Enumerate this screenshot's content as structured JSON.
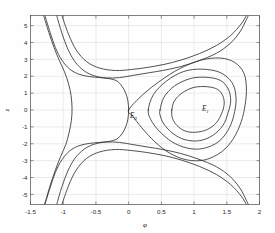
{
  "figure": {
    "background_color": "#fefefe",
    "curve_color": "#333333",
    "grid_color": "#d8d8d8",
    "axis_color": "#4a4a4a"
  },
  "chart_data": {
    "type": "line",
    "title": "",
    "subtitle": "",
    "xlabel": "φ",
    "ylabel": "z",
    "xlim": [
      -1.5,
      2.0
    ],
    "ylim": [
      -5.6,
      5.6
    ],
    "grid": true,
    "legend": null,
    "legend_position": "none",
    "xticks": [
      -1.5,
      -1,
      -0.5,
      0,
      0.5,
      1,
      1.5,
      2
    ],
    "xticklabels": [
      "-1.5",
      "-1",
      "-0.5",
      "0",
      "0.5",
      "1",
      "1.5",
      "2"
    ],
    "yticks": [
      -5,
      -4,
      -3,
      -2,
      -1,
      0,
      1,
      2,
      3,
      4,
      5
    ],
    "yticklabels": [
      "-5",
      "-4",
      "-3",
      "-2",
      "-1",
      "0",
      "1",
      "2",
      "3",
      "4",
      "5"
    ],
    "annotations": [
      {
        "text": "E",
        "subscript": "0",
        "x": 0.02,
        "y": -0.45,
        "name": "saddle-point-label"
      },
      {
        "text": "E",
        "subscript": "1",
        "x": 1.12,
        "y": -0.05,
        "name": "center-point-label"
      }
    ],
    "equilibria": [
      {
        "name": "E0",
        "type": "saddle",
        "x": 0.0,
        "y": 0.0
      },
      {
        "name": "E1",
        "type": "center",
        "x": 1.1,
        "y": 0.0
      }
    ],
    "series": [
      {
        "name": "separatrix",
        "type": "homoclinic-separatrix",
        "values": [
          [
            -1.28,
            5.6
          ],
          [
            -1.2,
            4.6
          ],
          [
            -1.12,
            3.7
          ],
          [
            -1.02,
            2.95
          ],
          [
            -0.9,
            2.42
          ],
          [
            -0.76,
            2.12
          ],
          [
            -0.6,
            1.98
          ],
          [
            -0.44,
            1.92
          ],
          [
            -0.3,
            1.86
          ],
          [
            -0.18,
            1.72
          ],
          [
            -0.1,
            1.4
          ],
          [
            -0.045,
            1.0
          ],
          [
            -0.012,
            0.55
          ],
          [
            0.0,
            0.0
          ],
          [
            -0.012,
            -0.55
          ],
          [
            -0.045,
            -1.0
          ],
          [
            -0.1,
            -1.4
          ],
          [
            -0.18,
            -1.72
          ],
          [
            -0.3,
            -1.86
          ],
          [
            -0.44,
            -1.92
          ],
          [
            -0.6,
            -1.98
          ],
          [
            -0.76,
            -2.12
          ],
          [
            -0.9,
            -2.42
          ],
          [
            -1.02,
            -2.95
          ],
          [
            -1.12,
            -3.7
          ],
          [
            -1.2,
            -4.6
          ],
          [
            -1.28,
            -5.6
          ]
        ]
      },
      {
        "name": "separatrix-loop",
        "type": "homoclinic-loop",
        "values": [
          [
            0.0,
            0.0
          ],
          [
            0.22,
            0.92
          ],
          [
            0.48,
            1.72
          ],
          [
            0.78,
            2.45
          ],
          [
            1.1,
            2.95
          ],
          [
            1.4,
            3.08
          ],
          [
            1.62,
            2.82
          ],
          [
            1.76,
            2.2
          ],
          [
            1.8,
            1.3
          ],
          [
            1.78,
            0.3
          ],
          [
            1.72,
            -0.7
          ],
          [
            1.6,
            -1.7
          ],
          [
            1.42,
            -2.48
          ],
          [
            1.16,
            -2.96
          ],
          [
            0.88,
            -2.95
          ],
          [
            0.62,
            -2.54
          ],
          [
            0.4,
            -1.88
          ],
          [
            0.2,
            -1.05
          ],
          [
            0.06,
            -0.35
          ],
          [
            0.0,
            0.0
          ]
        ]
      },
      {
        "name": "closed-orbit-1",
        "type": "periodic",
        "values": [
          [
            0.3,
            0.0
          ],
          [
            0.38,
            0.92
          ],
          [
            0.58,
            1.72
          ],
          [
            0.84,
            2.28
          ],
          [
            1.12,
            2.42
          ],
          [
            1.4,
            2.22
          ],
          [
            1.58,
            1.62
          ],
          [
            1.64,
            0.8
          ],
          [
            1.62,
            -0.1
          ],
          [
            1.54,
            -1.05
          ],
          [
            1.38,
            -1.86
          ],
          [
            1.14,
            -2.28
          ],
          [
            0.9,
            -2.26
          ],
          [
            0.66,
            -1.88
          ],
          [
            0.46,
            -1.22
          ],
          [
            0.34,
            -0.58
          ],
          [
            0.3,
            0.0
          ]
        ]
      },
      {
        "name": "closed-orbit-2",
        "type": "periodic",
        "values": [
          [
            0.48,
            0.0
          ],
          [
            0.54,
            0.76
          ],
          [
            0.7,
            1.42
          ],
          [
            0.94,
            1.86
          ],
          [
            1.18,
            1.94
          ],
          [
            1.4,
            1.76
          ],
          [
            1.52,
            1.26
          ],
          [
            1.56,
            0.58
          ],
          [
            1.52,
            -0.16
          ],
          [
            1.44,
            -0.92
          ],
          [
            1.28,
            -1.52
          ],
          [
            1.08,
            -1.82
          ],
          [
            0.86,
            -1.76
          ],
          [
            0.68,
            -1.4
          ],
          [
            0.54,
            -0.84
          ],
          [
            0.48,
            -0.3
          ],
          [
            0.48,
            0.0
          ]
        ]
      },
      {
        "name": "closed-orbit-3",
        "type": "periodic",
        "values": [
          [
            0.66,
            0.0
          ],
          [
            0.7,
            0.54
          ],
          [
            0.82,
            1.02
          ],
          [
            1.0,
            1.34
          ],
          [
            1.2,
            1.38
          ],
          [
            1.36,
            1.22
          ],
          [
            1.44,
            0.84
          ],
          [
            1.46,
            0.34
          ],
          [
            1.42,
            -0.22
          ],
          [
            1.34,
            -0.76
          ],
          [
            1.2,
            -1.16
          ],
          [
            1.02,
            -1.32
          ],
          [
            0.86,
            -1.24
          ],
          [
            0.74,
            -0.92
          ],
          [
            0.67,
            -0.5
          ],
          [
            0.66,
            0.0
          ]
        ]
      },
      {
        "name": "unbounded-upper-a",
        "type": "unbounded",
        "values": [
          [
            -1.1,
            5.6
          ],
          [
            -1.02,
            4.55
          ],
          [
            -0.93,
            3.62
          ],
          [
            -0.82,
            2.86
          ],
          [
            -0.68,
            2.32
          ],
          [
            -0.52,
            2.02
          ],
          [
            -0.34,
            1.9
          ],
          [
            -0.14,
            1.92
          ],
          [
            0.08,
            2.06
          ],
          [
            0.3,
            2.2
          ],
          [
            0.52,
            2.34
          ],
          [
            0.78,
            2.56
          ],
          [
            1.06,
            2.9
          ],
          [
            1.34,
            3.36
          ],
          [
            1.55,
            3.94
          ],
          [
            1.7,
            4.62
          ],
          [
            1.8,
            5.36
          ],
          [
            1.83,
            5.6
          ]
        ]
      },
      {
        "name": "unbounded-lower-a",
        "type": "unbounded",
        "values": [
          [
            -1.1,
            -5.6
          ],
          [
            -1.02,
            -4.55
          ],
          [
            -0.93,
            -3.62
          ],
          [
            -0.82,
            -2.86
          ],
          [
            -0.68,
            -2.32
          ],
          [
            -0.52,
            -2.02
          ],
          [
            -0.34,
            -1.9
          ],
          [
            -0.14,
            -1.92
          ],
          [
            0.08,
            -2.06
          ],
          [
            0.3,
            -2.2
          ],
          [
            0.52,
            -2.34
          ],
          [
            0.78,
            -2.56
          ],
          [
            1.06,
            -2.9
          ],
          [
            1.34,
            -3.36
          ],
          [
            1.55,
            -3.94
          ],
          [
            1.7,
            -4.62
          ],
          [
            1.8,
            -5.36
          ],
          [
            1.83,
            -5.6
          ]
        ]
      },
      {
        "name": "unbounded-upper-b",
        "type": "unbounded",
        "values": [
          [
            -1.02,
            5.6
          ],
          [
            -0.92,
            4.5
          ],
          [
            -0.8,
            3.55
          ],
          [
            -0.64,
            2.86
          ],
          [
            -0.44,
            2.48
          ],
          [
            -0.2,
            2.34
          ],
          [
            0.04,
            2.4
          ],
          [
            0.28,
            2.52
          ],
          [
            0.54,
            2.7
          ],
          [
            0.8,
            2.96
          ],
          [
            1.08,
            3.34
          ],
          [
            1.34,
            3.82
          ],
          [
            1.56,
            4.42
          ],
          [
            1.72,
            5.1
          ],
          [
            1.8,
            5.6
          ]
        ]
      },
      {
        "name": "unbounded-lower-b",
        "type": "unbounded",
        "values": [
          [
            -1.02,
            -5.6
          ],
          [
            -0.92,
            -4.5
          ],
          [
            -0.8,
            -3.55
          ],
          [
            -0.64,
            -2.86
          ],
          [
            -0.44,
            -2.48
          ],
          [
            -0.2,
            -2.34
          ],
          [
            0.04,
            -2.4
          ],
          [
            0.28,
            -2.52
          ],
          [
            0.54,
            -2.7
          ],
          [
            0.8,
            -2.96
          ],
          [
            1.08,
            -3.34
          ],
          [
            1.34,
            -3.82
          ],
          [
            1.56,
            -4.42
          ],
          [
            1.72,
            -5.1
          ],
          [
            1.8,
            -5.6
          ]
        ]
      },
      {
        "name": "outer-left-branch",
        "type": "unbounded-left",
        "values": [
          [
            -1.3,
            5.6
          ],
          [
            -1.22,
            4.6
          ],
          [
            -1.14,
            3.7
          ],
          [
            -1.06,
            2.94
          ],
          [
            -0.98,
            2.26
          ],
          [
            -0.92,
            1.58
          ],
          [
            -0.88,
            0.86
          ],
          [
            -0.865,
            0.1
          ],
          [
            -0.875,
            -0.62
          ],
          [
            -0.91,
            -1.34
          ],
          [
            -0.96,
            -2.04
          ],
          [
            -1.04,
            -2.76
          ],
          [
            -1.12,
            -3.56
          ],
          [
            -1.2,
            -4.48
          ],
          [
            -1.28,
            -5.52
          ],
          [
            -1.3,
            -5.6
          ]
        ]
      }
    ]
  }
}
